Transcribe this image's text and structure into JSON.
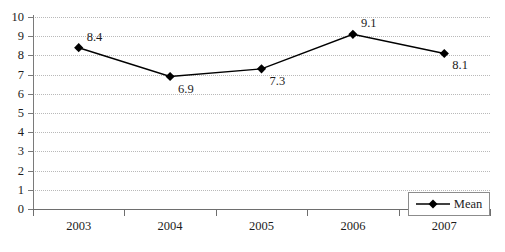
{
  "chart_data": {
    "type": "line",
    "title": "",
    "xlabel": "",
    "ylabel": "",
    "categories": [
      "2003",
      "2004",
      "2005",
      "2006",
      "2007"
    ],
    "series": [
      {
        "name": "Mean",
        "values": [
          8.4,
          6.9,
          7.3,
          9.1,
          8.1
        ],
        "point_labels": [
          "8.4",
          "6.9",
          "7.3",
          "9.1",
          "8.1"
        ],
        "marker": "diamond",
        "color": "#000000"
      }
    ],
    "ylim": [
      0,
      10
    ],
    "ytick_labels": [
      "0",
      "1",
      "2",
      "3",
      "4",
      "5",
      "6",
      "7",
      "8",
      "9",
      "10"
    ],
    "ytick_values": [
      0,
      1,
      2,
      3,
      4,
      5,
      6,
      7,
      8,
      9,
      10
    ],
    "grid": true,
    "grid_axis": "y",
    "grid_style": "dotted",
    "grid_color": "#b9b9b9",
    "legend_position": "bottom-right",
    "legend_entries": [
      "Mean"
    ],
    "axis_color": "#6e6e6e",
    "background_color": "#ffffff"
  },
  "legend": {
    "mean_label": "Mean"
  }
}
